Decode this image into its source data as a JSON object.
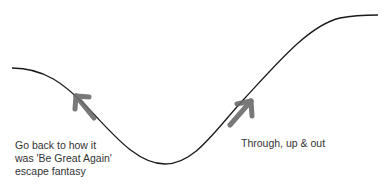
{
  "diagram": {
    "curve": {
      "color": "#1a1a1a"
    },
    "arrow_color": "#6b6b6b",
    "labels": {
      "left_line1": "Go back to how it",
      "left_line2": "was 'Be Great Again'",
      "left_line3": "escape fantasy",
      "right": "Through, up & out"
    }
  }
}
